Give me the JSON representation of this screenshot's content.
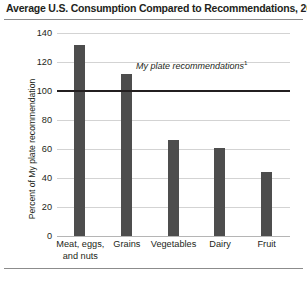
{
  "chart_data": {
    "type": "bar",
    "title": "Average U.S. Consumption Compared to Recommendations, 2013",
    "xlabel": "",
    "ylabel": "Percent of My plate recommendation",
    "categories": [
      "Meat, eggs,\nand nuts",
      "Grains",
      "Vegetables",
      "Dairy",
      "Fruit"
    ],
    "values": [
      132,
      112,
      66,
      61,
      44
    ],
    "ylim": [
      0,
      140
    ],
    "ytick_labels": [
      "0",
      "20",
      "40",
      "60",
      "80",
      "100",
      "120",
      "140"
    ],
    "ytick_values": [
      0,
      20,
      40,
      60,
      80,
      100,
      120,
      140
    ],
    "grid": true,
    "legend": "none",
    "annotations": [
      {
        "text": "My plate recommendations",
        "superscript": "1",
        "value": 100,
        "style": "italic"
      }
    ],
    "reference_line": {
      "value": 100,
      "label": "My plate recommendations",
      "color": "#231f20"
    },
    "colors": {
      "bar": "#4d4d4d",
      "gridline": "#d3d3d3",
      "reference_line": "#231f20",
      "rule": "#8c8c8c",
      "text": "#231f20"
    }
  }
}
